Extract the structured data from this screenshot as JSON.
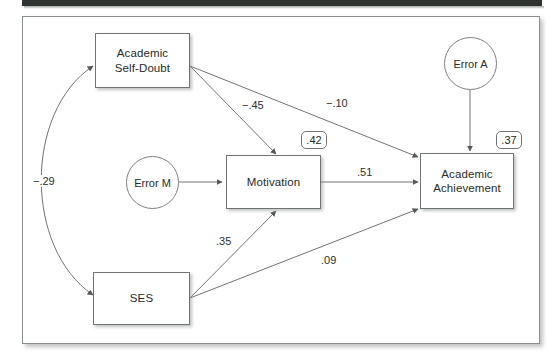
{
  "figure": {
    "type": "path-diagram",
    "title": "",
    "nodes": [
      {
        "id": "self_doubt",
        "label": "Academic\nSelf-Doubt",
        "line1": "Academic",
        "line2": "Self-Doubt",
        "shape": "rect"
      },
      {
        "id": "motivation",
        "label": "Motivation",
        "line1": "Motivation",
        "line2": "",
        "shape": "rect"
      },
      {
        "id": "achievement",
        "label": "Academic\nAchievement",
        "line1": "Academic",
        "line2": "Achievement",
        "shape": "rect"
      },
      {
        "id": "ses",
        "label": "SES",
        "line1": "SES",
        "line2": "",
        "shape": "rect"
      },
      {
        "id": "error_m",
        "label": "Error M",
        "line1": "Error M",
        "line2": "",
        "shape": "circle"
      },
      {
        "id": "error_a",
        "label": "Error A",
        "line1": "Error A",
        "line2": "",
        "shape": "circle"
      }
    ],
    "node_labels": {
      "self_doubt_line1": "Academic",
      "self_doubt_line2": "Self-Doubt",
      "motivation": "Motivation",
      "achievement_line1": "Academic",
      "achievement_line2": "Achievement",
      "ses": "SES",
      "error_m": "Error M",
      "error_a": "Error A"
    },
    "paths": [
      {
        "id": "sd_to_mot",
        "from": "self_doubt",
        "to": "motivation",
        "coefficient": "−.45",
        "kind": "directed"
      },
      {
        "id": "sd_to_ach",
        "from": "self_doubt",
        "to": "achievement",
        "coefficient": "−.10",
        "kind": "directed"
      },
      {
        "id": "ses_to_mot",
        "from": "ses",
        "to": "motivation",
        "coefficient": ".35",
        "kind": "directed"
      },
      {
        "id": "ses_to_ach",
        "from": "ses",
        "to": "achievement",
        "coefficient": ".09",
        "kind": "directed"
      },
      {
        "id": "mot_to_ach",
        "from": "motivation",
        "to": "achievement",
        "coefficient": ".51",
        "kind": "directed"
      },
      {
        "id": "sd_ses_cov",
        "from": "self_doubt",
        "to": "ses",
        "coefficient": "−.29",
        "kind": "covariance"
      },
      {
        "id": "errm_to_mot",
        "from": "error_m",
        "to": "motivation",
        "coefficient": "",
        "kind": "directed"
      },
      {
        "id": "erra_to_ach",
        "from": "error_a",
        "to": "achievement",
        "coefficient": "",
        "kind": "directed"
      }
    ],
    "coefficients": {
      "sd_to_mot": "−.45",
      "sd_to_ach": "−.10",
      "ses_to_mot": ".35",
      "ses_to_ach": ".09",
      "mot_to_ach": ".51",
      "sd_ses_cov": "−.29"
    },
    "variance_explained": {
      "motivation": ".42",
      "achievement": ".37"
    },
    "colors": {
      "stroke": "#6f7371",
      "text": "#262a28",
      "background": "#ffffff",
      "top_bar": "#2e3330",
      "frame_border": "#8b8f8d"
    }
  }
}
